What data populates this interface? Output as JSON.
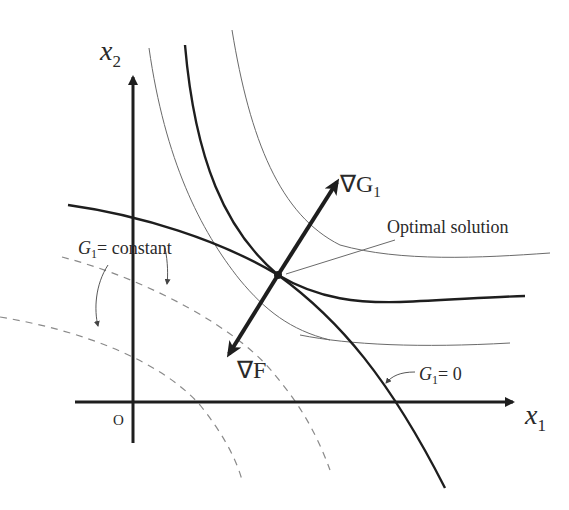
{
  "diagram": {
    "title_cutoff": "",
    "axes": {
      "x_label": "x",
      "x_sub": "1",
      "y_label": "x",
      "y_sub": "2",
      "origin_label": "O"
    },
    "labels": {
      "grad_g": "∇G",
      "grad_g_sub": "1",
      "grad_f": "∇F",
      "optimal": "Optimal solution",
      "g_const_G": "G",
      "g_const_sub": "1",
      "g_const_rest": "= constant",
      "g_zero_G": "G",
      "g_zero_sub": "1",
      "g_zero_rest": "= 0"
    },
    "colors": {
      "thick": "#1e1e1e",
      "thin": "#6a6a6a",
      "dashed": "#8a8a8a",
      "text": "#2a2a2a"
    }
  }
}
